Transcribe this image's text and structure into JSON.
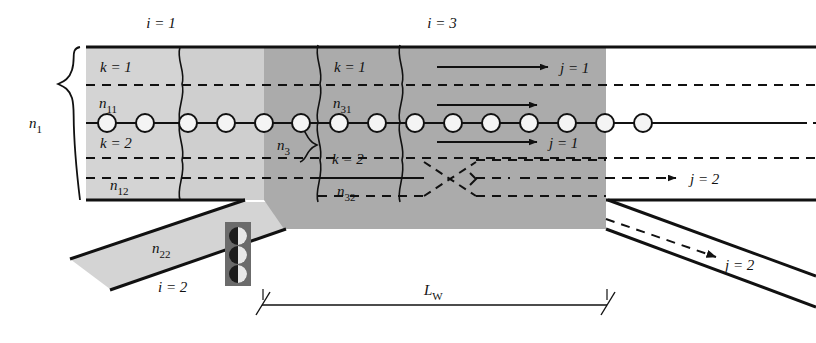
{
  "diagram": {
    "colors": {
      "light_gray": "#d2d2d2",
      "mid_gray": "#c3c3c3",
      "dark_gray": "#a8a8a8",
      "line": "#111111",
      "cell_fill": "#f2f2f2",
      "signal_box": "#6e6e6e"
    },
    "labels": {
      "i_eq_1": "i = 1",
      "i_eq_3": "i = 3",
      "i_eq_2": "i = 2",
      "k_eq_1_left": "k = 1",
      "k_eq_2_left": "k = 2",
      "k_eq_1_right": "k = 1",
      "k_eq_2_right": "k = 2",
      "n_1": "n",
      "n_1_sub": "1",
      "n_11": "n",
      "n_11_sub": "11",
      "n_12": "n",
      "n_12_sub": "12",
      "n_3": "n",
      "n_3_sub": "3",
      "n_31": "n",
      "n_31_sub": "31",
      "n_32": "n",
      "n_32_sub": "32",
      "n_22": "n",
      "n_22_sub": "22",
      "j_eq_1_top": "j = 1",
      "j_eq_1_mid": "j = 1",
      "j_eq_2_top": "j = 2",
      "j_eq_2_bottom": "j = 2",
      "L_W": "L",
      "L_W_sub": "W"
    },
    "geometry": {
      "mainline_top_y": 47,
      "mainline_center_y": 123,
      "mainline_bottom_y": 200,
      "dashed_rows_y": [
        85,
        158,
        178
      ],
      "light_shade_x": [
        86,
        264
      ],
      "dark_shade_x": [
        264,
        606
      ],
      "vehicle_count": 15,
      "vehicle_first_x": 107,
      "vehicle_spacing": 38,
      "vehicle_radius": 9,
      "dim_line_y": 305,
      "dim_line_x": [
        262,
        607
      ]
    },
    "arrows": [
      {
        "name": "j1-top",
        "y": 67,
        "x1": 437,
        "x2": 545
      },
      {
        "name": "j1-mid",
        "y": 105,
        "x1": 437,
        "x2": 534
      },
      {
        "name": "j1-bottom",
        "y": 142,
        "x1": 437,
        "x2": 534
      },
      {
        "name": "j2-dashed-top",
        "y": 178,
        "x1": 520,
        "x2": 672
      },
      {
        "name": "j2-dashed-ramp",
        "y": 0,
        "x1": 0,
        "x2": 0
      }
    ]
  }
}
